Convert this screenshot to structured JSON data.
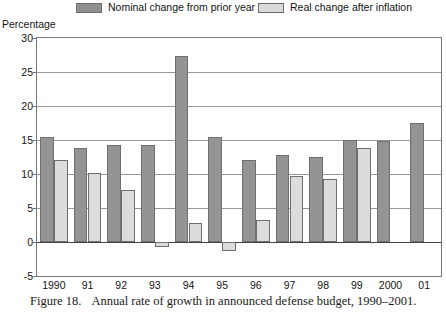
{
  "figure": {
    "number_label": "Figure 18.",
    "caption": "Annual rate of growth in announced defense budget, 1990–2001."
  },
  "legend": {
    "position": "top",
    "entries": [
      {
        "label": "Nominal change from prior year",
        "color": "#949494",
        "icon": "legend-swatch"
      },
      {
        "label": "Real change after inflation",
        "color": "#dcdcdc",
        "icon": "legend-swatch"
      }
    ]
  },
  "axes": {
    "y_title": "Percentage",
    "y_ticks": [
      "30",
      "25",
      "20",
      "15",
      "10",
      "5",
      "0",
      "-5"
    ],
    "x_ticks": [
      "1990",
      "91",
      "92",
      "93",
      "94",
      "95",
      "96",
      "97",
      "98",
      "99",
      "2000",
      "01"
    ]
  },
  "chart_data": {
    "type": "bar",
    "title": "Annual rate of growth in announced defense budget, 1990–2001",
    "xlabel": "",
    "ylabel": "Percentage",
    "ylim": [
      -5,
      30
    ],
    "ytick_values": [
      30,
      25,
      20,
      15,
      10,
      5,
      0,
      -5
    ],
    "grid": true,
    "legend_position": "top",
    "categories": [
      "1990",
      "91",
      "92",
      "93",
      "94",
      "95",
      "96",
      "97",
      "98",
      "99",
      "2000",
      "01"
    ],
    "series": [
      {
        "name": "Nominal change from prior year",
        "color": "#949494",
        "values": [
          15.4,
          13.8,
          14.2,
          14.2,
          27.3,
          15.4,
          12.1,
          12.8,
          12.5,
          15.0,
          14.8,
          17.5
        ]
      },
      {
        "name": "Real change after inflation",
        "color": "#dcdcdc",
        "values": [
          12.0,
          10.1,
          7.6,
          -0.8,
          2.8,
          -1.3,
          3.3,
          9.7,
          9.3,
          13.8,
          null,
          null
        ]
      }
    ]
  }
}
